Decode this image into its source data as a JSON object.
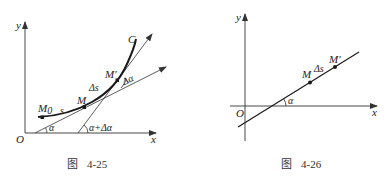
{
  "figures": [
    {
      "id": "fig-4-25",
      "caption_prefix": "图",
      "caption_number": "4-25",
      "axes": {
        "x_label": "x",
        "y_label": "y",
        "origin_label": "O"
      },
      "curve_label": "C",
      "points": {
        "m0": "M",
        "m0_sub": "0",
        "m": "M",
        "m_prime": "M′"
      },
      "labels": {
        "arc_s": "s",
        "arc_delta_s": "Δs",
        "angle_alpha": "α",
        "angle_alpha_plus": "α+Δα",
        "delta_alpha": "Δα"
      }
    },
    {
      "id": "fig-4-26",
      "caption_prefix": "图",
      "caption_number": "4-26",
      "axes": {
        "x_label": "x",
        "y_label": "y",
        "origin_label": "O"
      },
      "points": {
        "m": "M",
        "m_prime": "M′"
      },
      "labels": {
        "arc_delta_s": "Δs",
        "angle_alpha": "α"
      }
    }
  ]
}
